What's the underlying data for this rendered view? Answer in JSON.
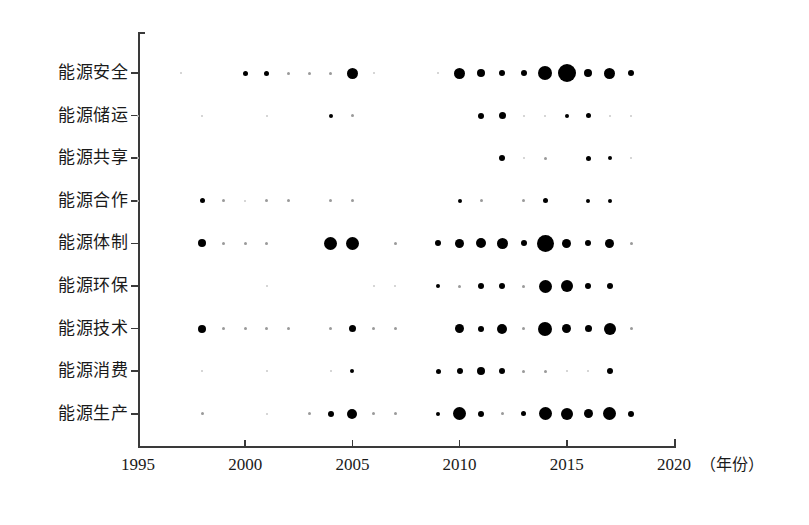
{
  "chart_data": {
    "type": "scatter",
    "title": "",
    "xlabel": "（年份）",
    "ylabel": "",
    "xlim": [
      1995,
      2020
    ],
    "xticks": [
      "1995",
      "2000",
      "2005",
      "2010",
      "2015",
      "2020"
    ],
    "xtick_values": [
      1995,
      2000,
      2005,
      2010,
      2015,
      2020
    ],
    "categories": [
      "能源安全",
      "能源储运",
      "能源共享",
      "能源合作",
      "能源体制",
      "能源环保",
      "能源技术",
      "能源消费",
      "能源生产"
    ],
    "grid": false,
    "legend": "none",
    "size_encoding": "bubble-area-proportional-to-count",
    "series": [
      {
        "name": "能源安全",
        "points": [
          {
            "x": 1997,
            "size": 2
          },
          {
            "x": 2000,
            "size": 5
          },
          {
            "x": 2001,
            "size": 5
          },
          {
            "x": 2002,
            "size": 3
          },
          {
            "x": 2003,
            "size": 3
          },
          {
            "x": 2004,
            "size": 3
          },
          {
            "x": 2005,
            "size": 11
          },
          {
            "x": 2006,
            "size": 2
          },
          {
            "x": 2009,
            "size": 2
          },
          {
            "x": 2010,
            "size": 11
          },
          {
            "x": 2011,
            "size": 8
          },
          {
            "x": 2012,
            "size": 6
          },
          {
            "x": 2013,
            "size": 6
          },
          {
            "x": 2014,
            "size": 14
          },
          {
            "x": 2015,
            "size": 18
          },
          {
            "x": 2016,
            "size": 8
          },
          {
            "x": 2017,
            "size": 11
          },
          {
            "x": 2018,
            "size": 6
          }
        ]
      },
      {
        "name": "能源储运",
        "points": [
          {
            "x": 1995,
            "size": 2
          },
          {
            "x": 1998,
            "size": 2
          },
          {
            "x": 2001,
            "size": 2
          },
          {
            "x": 2004,
            "size": 4
          },
          {
            "x": 2005,
            "size": 3
          },
          {
            "x": 2011,
            "size": 6
          },
          {
            "x": 2012,
            "size": 7
          },
          {
            "x": 2013,
            "size": 2
          },
          {
            "x": 2014,
            "size": 2
          },
          {
            "x": 2015,
            "size": 4
          },
          {
            "x": 2016,
            "size": 5
          },
          {
            "x": 2017,
            "size": 2
          },
          {
            "x": 2018,
            "size": 2
          }
        ]
      },
      {
        "name": "能源共享",
        "points": [
          {
            "x": 1995,
            "size": 2
          },
          {
            "x": 2012,
            "size": 6
          },
          {
            "x": 2013,
            "size": 2
          },
          {
            "x": 2014,
            "size": 3
          },
          {
            "x": 2016,
            "size": 5
          },
          {
            "x": 2017,
            "size": 4
          },
          {
            "x": 2018,
            "size": 2
          }
        ]
      },
      {
        "name": "能源合作",
        "points": [
          {
            "x": 1995,
            "size": 2
          },
          {
            "x": 1998,
            "size": 5
          },
          {
            "x": 1999,
            "size": 3
          },
          {
            "x": 2000,
            "size": 2
          },
          {
            "x": 2001,
            "size": 3
          },
          {
            "x": 2002,
            "size": 3
          },
          {
            "x": 2004,
            "size": 3
          },
          {
            "x": 2005,
            "size": 3
          },
          {
            "x": 2010,
            "size": 4
          },
          {
            "x": 2011,
            "size": 3
          },
          {
            "x": 2013,
            "size": 3
          },
          {
            "x": 2014,
            "size": 5
          },
          {
            "x": 2016,
            "size": 4
          },
          {
            "x": 2017,
            "size": 4
          }
        ]
      },
      {
        "name": "能源体制",
        "points": [
          {
            "x": 1998,
            "size": 8
          },
          {
            "x": 1999,
            "size": 3
          },
          {
            "x": 2000,
            "size": 3
          },
          {
            "x": 2001,
            "size": 3
          },
          {
            "x": 2004,
            "size": 13
          },
          {
            "x": 2005,
            "size": 13
          },
          {
            "x": 2007,
            "size": 3
          },
          {
            "x": 2009,
            "size": 6
          },
          {
            "x": 2010,
            "size": 9
          },
          {
            "x": 2011,
            "size": 10
          },
          {
            "x": 2012,
            "size": 11
          },
          {
            "x": 2013,
            "size": 6
          },
          {
            "x": 2014,
            "size": 17
          },
          {
            "x": 2015,
            "size": 9
          },
          {
            "x": 2016,
            "size": 6
          },
          {
            "x": 2017,
            "size": 9
          },
          {
            "x": 2018,
            "size": 3
          }
        ]
      },
      {
        "name": "能源环保",
        "points": [
          {
            "x": 2001,
            "size": 2
          },
          {
            "x": 2006,
            "size": 2
          },
          {
            "x": 2007,
            "size": 2
          },
          {
            "x": 2009,
            "size": 4
          },
          {
            "x": 2010,
            "size": 3
          },
          {
            "x": 2011,
            "size": 6
          },
          {
            "x": 2012,
            "size": 6
          },
          {
            "x": 2013,
            "size": 3
          },
          {
            "x": 2014,
            "size": 13
          },
          {
            "x": 2015,
            "size": 12
          },
          {
            "x": 2016,
            "size": 6
          },
          {
            "x": 2017,
            "size": 6
          }
        ]
      },
      {
        "name": "能源技术",
        "points": [
          {
            "x": 1998,
            "size": 8
          },
          {
            "x": 1999,
            "size": 3
          },
          {
            "x": 2000,
            "size": 3
          },
          {
            "x": 2001,
            "size": 3
          },
          {
            "x": 2002,
            "size": 3
          },
          {
            "x": 2004,
            "size": 3
          },
          {
            "x": 2005,
            "size": 7
          },
          {
            "x": 2006,
            "size": 3
          },
          {
            "x": 2007,
            "size": 3
          },
          {
            "x": 2010,
            "size": 9
          },
          {
            "x": 2011,
            "size": 6
          },
          {
            "x": 2012,
            "size": 10
          },
          {
            "x": 2013,
            "size": 3
          },
          {
            "x": 2014,
            "size": 14
          },
          {
            "x": 2015,
            "size": 9
          },
          {
            "x": 2016,
            "size": 7
          },
          {
            "x": 2017,
            "size": 12
          },
          {
            "x": 2018,
            "size": 3
          }
        ]
      },
      {
        "name": "能源消费",
        "points": [
          {
            "x": 1998,
            "size": 2
          },
          {
            "x": 2001,
            "size": 2
          },
          {
            "x": 2004,
            "size": 2
          },
          {
            "x": 2005,
            "size": 4
          },
          {
            "x": 2009,
            "size": 5
          },
          {
            "x": 2010,
            "size": 6
          },
          {
            "x": 2011,
            "size": 8
          },
          {
            "x": 2012,
            "size": 6
          },
          {
            "x": 2013,
            "size": 3
          },
          {
            "x": 2014,
            "size": 3
          },
          {
            "x": 2015,
            "size": 2
          },
          {
            "x": 2016,
            "size": 2
          },
          {
            "x": 2017,
            "size": 6
          }
        ]
      },
      {
        "name": "能源生产",
        "points": [
          {
            "x": 1998,
            "size": 3
          },
          {
            "x": 2001,
            "size": 2
          },
          {
            "x": 2003,
            "size": 3
          },
          {
            "x": 2004,
            "size": 6
          },
          {
            "x": 2005,
            "size": 10
          },
          {
            "x": 2006,
            "size": 3
          },
          {
            "x": 2007,
            "size": 3
          },
          {
            "x": 2009,
            "size": 4
          },
          {
            "x": 2010,
            "size": 13
          },
          {
            "x": 2011,
            "size": 6
          },
          {
            "x": 2012,
            "size": 3
          },
          {
            "x": 2013,
            "size": 5
          },
          {
            "x": 2014,
            "size": 13
          },
          {
            "x": 2015,
            "size": 12
          },
          {
            "x": 2016,
            "size": 9
          },
          {
            "x": 2017,
            "size": 13
          },
          {
            "x": 2018,
            "size": 6
          }
        ]
      }
    ]
  }
}
